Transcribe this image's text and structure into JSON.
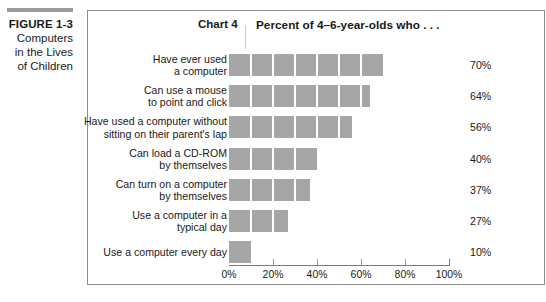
{
  "caption": {
    "figure_label": "FIGURE 1-3",
    "lines": [
      "Computers",
      "in the Lives",
      "of Children"
    ]
  },
  "header": {
    "chart_number": "Chart 4",
    "title": "Percent of 4–6-year-olds who . . ."
  },
  "colors": {
    "bar": "#a6a6a6",
    "rule": "#9b9b9b",
    "border": "#8e8e8e",
    "text": "#1a1a1a"
  },
  "chart_data": {
    "type": "bar",
    "orientation": "horizontal",
    "title": "Percent of 4–6-year-olds who . . .",
    "xlabel": "",
    "ylabel": "",
    "xlim": [
      0,
      100
    ],
    "grid": false,
    "segmented_bars": true,
    "segment_step": 10,
    "categories": [
      "Have ever used\na computer",
      "Can use a mouse\nto point and click",
      "Have used a computer without\nsitting on their parent's lap",
      "Can load a CD-ROM\nby themselves",
      "Can turn on a computer\nby themselves",
      "Use a computer in a\ntypical day",
      "Use a computer every day"
    ],
    "category_lines": [
      [
        "Have ever used",
        "a computer"
      ],
      [
        "Can use a mouse",
        "to point and click"
      ],
      [
        "Have used a computer without",
        "sitting on their parent's lap"
      ],
      [
        "Can load a CD-ROM",
        "by themselves"
      ],
      [
        "Can turn on a computer",
        "by themselves"
      ],
      [
        "Use a computer in a",
        "typical day"
      ],
      [
        "Use a computer every day"
      ]
    ],
    "values": [
      70,
      64,
      56,
      40,
      37,
      27,
      10
    ],
    "value_labels": [
      "70%",
      "64%",
      "56%",
      "40%",
      "37%",
      "27%",
      "10%"
    ],
    "xticks": [
      0,
      20,
      40,
      60,
      80,
      100
    ],
    "xtick_labels": [
      "0%",
      "20%",
      "40%",
      "60%",
      "80%",
      "100%"
    ]
  }
}
